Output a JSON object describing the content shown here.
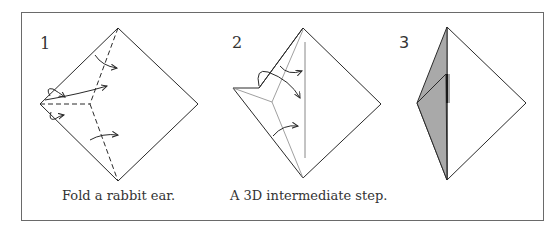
{
  "figure": {
    "steps": [
      {
        "number": "1",
        "caption": "Fold a rabbit ear."
      },
      {
        "number": "2",
        "caption": "A 3D intermediate step."
      },
      {
        "number": "3",
        "caption": ""
      }
    ],
    "colors": {
      "line": "#2a2a2a",
      "frame": "#6a6a6a",
      "shade": "#a9a9a9",
      "paper": "#ffffff"
    }
  }
}
